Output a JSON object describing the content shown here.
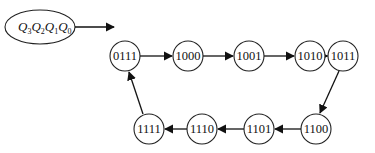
{
  "diagram": {
    "type": "state-transition-cycle",
    "legend": {
      "variables": [
        {
          "name": "Q",
          "sub": "3"
        },
        {
          "name": "Q",
          "sub": "2"
        },
        {
          "name": "Q",
          "sub": "1"
        },
        {
          "name": "Q",
          "sub": "0"
        }
      ]
    },
    "states": [
      {
        "id": "s0",
        "label": "0111"
      },
      {
        "id": "s1",
        "label": "1000"
      },
      {
        "id": "s2",
        "label": "1001"
      },
      {
        "id": "s3",
        "label": "1010"
      },
      {
        "id": "s4",
        "label": "1011"
      },
      {
        "id": "s5",
        "label": "1100"
      },
      {
        "id": "s6",
        "label": "1101"
      },
      {
        "id": "s7",
        "label": "1110"
      },
      {
        "id": "s8",
        "label": "1111"
      }
    ],
    "transitions": [
      {
        "from": "0111",
        "to": "1000"
      },
      {
        "from": "1000",
        "to": "1001"
      },
      {
        "from": "1001",
        "to": "1010"
      },
      {
        "from": "1010",
        "to": "1011"
      },
      {
        "from": "1011",
        "to": "1100"
      },
      {
        "from": "1100",
        "to": "1101"
      },
      {
        "from": "1101",
        "to": "1110"
      },
      {
        "from": "1110",
        "to": "1111"
      },
      {
        "from": "1111",
        "to": "0111"
      }
    ]
  }
}
